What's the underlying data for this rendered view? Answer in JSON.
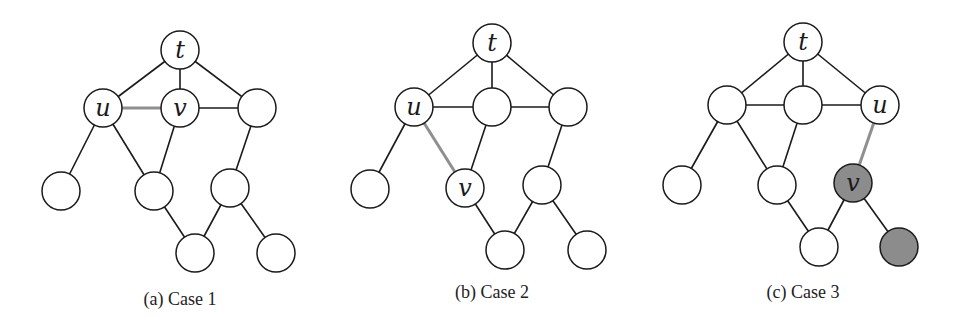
{
  "colors": {
    "stroke": "#1a1a1a",
    "node_fill": "#ffffff",
    "shaded_fill": "#8c8c8c",
    "highlight_edge": "#8f8f8f"
  },
  "node_radius": 19,
  "panels": [
    {
      "caption": "(a) Case 1",
      "caption_pos": [
        180,
        305
      ],
      "nodes": [
        {
          "id": "t",
          "x": 180,
          "y": 50,
          "label": "t",
          "shaded": false
        },
        {
          "id": "u",
          "x": 103,
          "y": 108,
          "label": "u",
          "shaded": false
        },
        {
          "id": "v",
          "x": 180,
          "y": 108,
          "label": "v",
          "shaded": false
        },
        {
          "id": "r1",
          "x": 257,
          "y": 108,
          "label": "",
          "shaded": false
        },
        {
          "id": "a",
          "x": 61,
          "y": 191,
          "label": "",
          "shaded": false
        },
        {
          "id": "b",
          "x": 154,
          "y": 191,
          "label": "",
          "shaded": false
        },
        {
          "id": "c",
          "x": 230,
          "y": 188,
          "label": "",
          "shaded": false
        },
        {
          "id": "d",
          "x": 195,
          "y": 253,
          "label": "",
          "shaded": false
        },
        {
          "id": "e",
          "x": 276,
          "y": 253,
          "label": "",
          "shaded": false
        }
      ],
      "edges": [
        [
          "t",
          "u",
          false
        ],
        [
          "t",
          "v",
          false
        ],
        [
          "t",
          "r1",
          false
        ],
        [
          "u",
          "v",
          true
        ],
        [
          "v",
          "r1",
          false
        ],
        [
          "u",
          "a",
          false
        ],
        [
          "u",
          "b",
          false
        ],
        [
          "v",
          "b",
          false
        ],
        [
          "r1",
          "c",
          false
        ],
        [
          "b",
          "d",
          false
        ],
        [
          "c",
          "d",
          false
        ],
        [
          "c",
          "e",
          false
        ]
      ]
    },
    {
      "caption": "(b) Case 2",
      "caption_pos": [
        492,
        298
      ],
      "nodes": [
        {
          "id": "t",
          "x": 492,
          "y": 43,
          "label": "t",
          "shaded": false
        },
        {
          "id": "u",
          "x": 414,
          "y": 107,
          "label": "u",
          "shaded": false
        },
        {
          "id": "m",
          "x": 492,
          "y": 107,
          "label": "",
          "shaded": false
        },
        {
          "id": "r1",
          "x": 568,
          "y": 107,
          "label": "",
          "shaded": false
        },
        {
          "id": "a",
          "x": 370,
          "y": 189,
          "label": "",
          "shaded": false
        },
        {
          "id": "v",
          "x": 465,
          "y": 188,
          "label": "v",
          "shaded": false
        },
        {
          "id": "c",
          "x": 542,
          "y": 185,
          "label": "",
          "shaded": false
        },
        {
          "id": "d",
          "x": 505,
          "y": 250,
          "label": "",
          "shaded": false
        },
        {
          "id": "e",
          "x": 587,
          "y": 250,
          "label": "",
          "shaded": false
        }
      ],
      "edges": [
        [
          "t",
          "u",
          false
        ],
        [
          "t",
          "m",
          false
        ],
        [
          "t",
          "r1",
          false
        ],
        [
          "u",
          "m",
          false
        ],
        [
          "m",
          "r1",
          false
        ],
        [
          "u",
          "a",
          false
        ],
        [
          "u",
          "v",
          true
        ],
        [
          "m",
          "v",
          false
        ],
        [
          "r1",
          "c",
          false
        ],
        [
          "v",
          "d",
          false
        ],
        [
          "c",
          "d",
          false
        ],
        [
          "c",
          "e",
          false
        ]
      ]
    },
    {
      "caption": "(c) Case 3",
      "caption_pos": [
        803,
        298
      ],
      "nodes": [
        {
          "id": "t",
          "x": 803,
          "y": 42,
          "label": "t",
          "shaded": false
        },
        {
          "id": "l",
          "x": 727,
          "y": 105,
          "label": "",
          "shaded": false
        },
        {
          "id": "m",
          "x": 803,
          "y": 105,
          "label": "",
          "shaded": false
        },
        {
          "id": "u",
          "x": 880,
          "y": 105,
          "label": "u",
          "shaded": false
        },
        {
          "id": "a",
          "x": 682,
          "y": 185,
          "label": "",
          "shaded": false
        },
        {
          "id": "b",
          "x": 777,
          "y": 185,
          "label": "",
          "shaded": false
        },
        {
          "id": "v",
          "x": 853,
          "y": 183,
          "label": "v",
          "shaded": true
        },
        {
          "id": "d",
          "x": 819,
          "y": 247,
          "label": "",
          "shaded": false
        },
        {
          "id": "e",
          "x": 899,
          "y": 247,
          "label": "",
          "shaded": true
        }
      ],
      "edges": [
        [
          "t",
          "l",
          false
        ],
        [
          "t",
          "m",
          false
        ],
        [
          "t",
          "u",
          false
        ],
        [
          "l",
          "m",
          false
        ],
        [
          "m",
          "u",
          false
        ],
        [
          "l",
          "a",
          false
        ],
        [
          "l",
          "b",
          false
        ],
        [
          "m",
          "b",
          false
        ],
        [
          "u",
          "v",
          true
        ],
        [
          "b",
          "d",
          false
        ],
        [
          "v",
          "d",
          false
        ],
        [
          "v",
          "e",
          false
        ]
      ]
    }
  ]
}
